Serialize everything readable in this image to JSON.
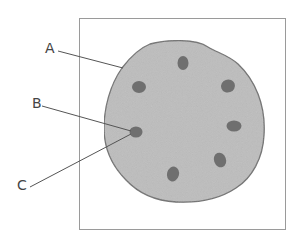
{
  "figure": {
    "labels": {
      "a": "A",
      "b": "B",
      "c": "C"
    },
    "colors": {
      "cell_fill": "#bdbdbd",
      "cell_stroke": "#6e6e6e",
      "spot_fill": "#6f6f6f",
      "frame": "#9a9a9a",
      "leader": "#555555"
    },
    "spot_count": 7
  }
}
